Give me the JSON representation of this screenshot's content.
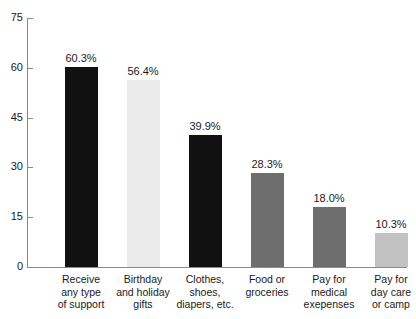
{
  "chart_data": {
    "type": "bar",
    "title": "",
    "subtitle": "",
    "xlabel": "",
    "ylabel": "",
    "ylim": [
      0,
      75
    ],
    "ytick_values": [
      0,
      15,
      30,
      45,
      60,
      75
    ],
    "ytick_labels": [
      "0",
      "15",
      "30",
      "45",
      "60",
      "75"
    ],
    "grid": false,
    "legend": null,
    "categories": [
      "Receive any type of support",
      "Birthday and holiday gifts",
      "Clothes, shoes, diapers, etc.",
      "Food or groceries",
      "Pay for medical exepenses",
      "Pay for day care or camp"
    ],
    "category_lines": [
      [
        "Receive",
        "any type",
        "of support"
      ],
      [
        "Birthday",
        "and holiday",
        "gifts"
      ],
      [
        "Clothes,",
        "shoes,",
        "diapers, etc."
      ],
      [
        "Food or",
        "groceries"
      ],
      [
        "Pay for",
        "medical",
        "exepenses"
      ],
      [
        "Pay for",
        "day care",
        "or camp"
      ]
    ],
    "values": [
      60.3,
      56.4,
      39.9,
      28.3,
      18.0,
      10.3
    ],
    "value_labels": [
      "60.3%",
      "56.4%",
      "39.9%",
      "28.3%",
      "18.0%",
      "10.3%"
    ],
    "bar_colors": [
      "#111111",
      "#ebebeb",
      "#111111",
      "#6e6e6e",
      "#6e6e6e",
      "#c2c2c2"
    ]
  },
  "axis": {
    "line_color": "#8a8a8a"
  }
}
